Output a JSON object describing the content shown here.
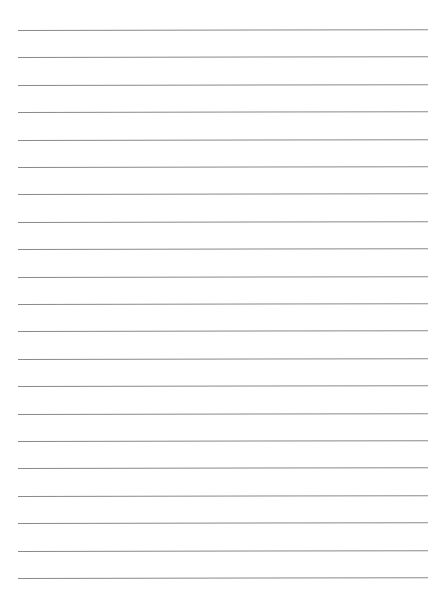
{
  "page": {
    "type": "lined-paper",
    "background_color": "#ffffff",
    "line_color": "#8a8a8a",
    "line_count": 21,
    "first_line_y": 30,
    "line_spacing": 27.4,
    "line_left": 18
  }
}
